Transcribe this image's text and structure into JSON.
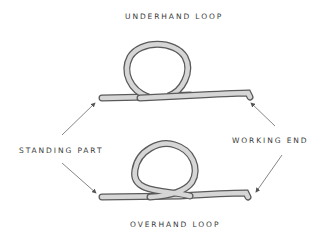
{
  "diagram": {
    "title_top": "UNDERHAND LOOP",
    "title_bottom": "OVERHAND LOOP",
    "label_left": "STANDING PART",
    "label_right": "WORKING END",
    "colors": {
      "rope_fill": "#d6d6d6",
      "rope_outline": "#5a5a5a",
      "text": "#3a3a3a",
      "arrow": "#666666"
    }
  }
}
